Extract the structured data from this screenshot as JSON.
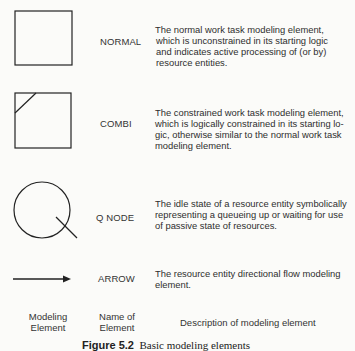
{
  "figure": {
    "caption_number": "Figure 5.2",
    "caption_text": "Basic modeling elements",
    "colors": {
      "background": "#fbfbf9",
      "stroke": "#222222",
      "text": "#2e2e2e"
    }
  },
  "elements": [
    {
      "shape": "square-icon",
      "name": "NORMAL",
      "description_lines": [
        "The normal work task modeling element,",
        "which is unconstrained in its starting logic",
        "and indicates active processing of (or by)",
        "resource entities."
      ]
    },
    {
      "shape": "square-with-corner-slash-icon",
      "name": "COMBI",
      "description_lines": [
        "The constrained work task modeling element,",
        "which is logically constrained in its starting lo-",
        "gic, otherwise similar to the normal work task",
        "modeling element."
      ]
    },
    {
      "shape": "circle-with-tail-icon",
      "name": "Q NODE",
      "description_lines": [
        "The idle state of a resource entity symbolically",
        "representing a queueing up or waiting for use",
        "of passive state of resources."
      ]
    },
    {
      "shape": "arrow-right-icon",
      "name": "ARROW",
      "description_lines": [
        "The resource entity directional flow modeling",
        "element."
      ]
    }
  ],
  "column_headers": {
    "col1_line1": "Modeling",
    "col1_line2": "Element",
    "col2_line1": "Name of",
    "col2_line2": "Element",
    "col3": "Description of modeling element"
  }
}
